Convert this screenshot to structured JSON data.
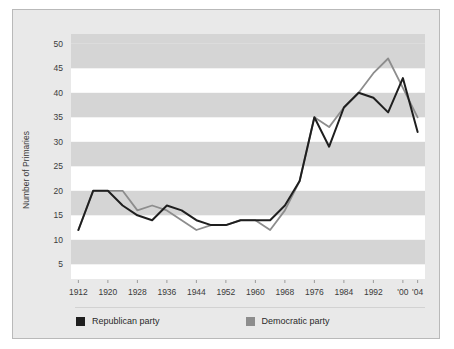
{
  "figure": {
    "background_color": "#e9e9e9",
    "border_color": "#b9b9b9",
    "plot_background_color": "#ffffff",
    "band_color": "#d5d5d5"
  },
  "legend": {
    "position": "bottom",
    "items": [
      {
        "label": "Republican party",
        "color": "#1f1f1f",
        "swatch": "square-swatch"
      },
      {
        "label": "Democratic party",
        "color": "#8d8d8d",
        "swatch": "square-swatch"
      }
    ]
  },
  "chart_data": {
    "type": "line",
    "title": "",
    "subtitle": "",
    "xlabel": "",
    "ylabel": "Number of Primaries",
    "xlim": [
      1910,
      2006
    ],
    "ylim": [
      2,
      52
    ],
    "yticks": [
      5,
      10,
      15,
      20,
      25,
      30,
      35,
      40,
      45,
      50
    ],
    "ytick_labels": [
      "5",
      "10",
      "15",
      "20",
      "25",
      "30",
      "35",
      "40",
      "45",
      "50"
    ],
    "xticks": [
      1912,
      1920,
      1928,
      1936,
      1944,
      1952,
      1960,
      1968,
      1976,
      1984,
      1992,
      2000,
      2004
    ],
    "xtick_labels": [
      "1912",
      "1920",
      "1928",
      "1936",
      "1944",
      "1952",
      "1960",
      "1968",
      "1976",
      "1984",
      "1992",
      "'00",
      "'04"
    ],
    "grid": "horizontal-bands",
    "legend_position": "bottom",
    "x": [
      1912,
      1916,
      1920,
      1924,
      1928,
      1932,
      1936,
      1940,
      1944,
      1948,
      1952,
      1956,
      1960,
      1964,
      1968,
      1972,
      1976,
      1980,
      1984,
      1988,
      1992,
      1996,
      2000,
      2004
    ],
    "series": [
      {
        "name": "Republican party",
        "color": "#1f1f1f",
        "values": [
          12,
          20,
          20,
          17,
          15,
          14,
          17,
          16,
          14,
          13,
          13,
          14,
          14,
          14,
          17,
          22,
          35,
          29,
          37,
          40,
          39,
          36,
          43,
          32
        ]
      },
      {
        "name": "Democratic party",
        "color": "#8d8d8d",
        "values": [
          12,
          20,
          20,
          20,
          16,
          17,
          16,
          14,
          12,
          13,
          13,
          14,
          14,
          12,
          16,
          22,
          35,
          33,
          37,
          40,
          44,
          47,
          41,
          35
        ]
      }
    ]
  }
}
